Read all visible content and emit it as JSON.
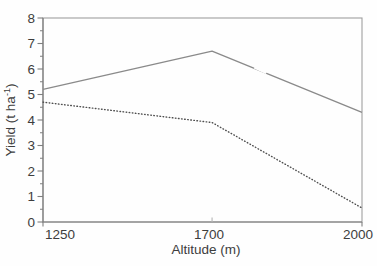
{
  "figure": {
    "kind": "scanned line chart",
    "title": ""
  },
  "colors": {
    "background": "#fefefe",
    "frame": "#9e9e9e",
    "axis": "#7f7f7f",
    "inner_tick": "#b5b5b5",
    "text": "#3d3d3d",
    "solid_line": "#8a8a8a",
    "dotted_line": "#4f4f4f"
  },
  "chart_data": {
    "type": "line",
    "title": "",
    "xlabel": "Altitude (m)",
    "ylabel": "Yield (t ha⁻¹)",
    "x": [
      1250,
      1700,
      2000
    ],
    "x_ticks": [
      1250,
      1700,
      2000
    ],
    "x_tick_labels": [
      "1250",
      "1700",
      "2000"
    ],
    "x_tick_fractions": [
      0,
      0.53,
      1
    ],
    "xlim": [
      1250,
      2000
    ],
    "ylim": [
      0,
      8
    ],
    "y_major_ticks": [
      0,
      1,
      2,
      3,
      4,
      5,
      6,
      7,
      8
    ],
    "y_minor_step": 0.5,
    "grid": false,
    "legend": "none",
    "series": [
      {
        "name": "upper solid line",
        "style": "solid",
        "values": [
          5.2,
          6.7,
          4.3
        ]
      },
      {
        "name": "lower dotted line",
        "style": "dotted",
        "values": [
          4.7,
          3.9,
          0.55
        ]
      }
    ]
  }
}
